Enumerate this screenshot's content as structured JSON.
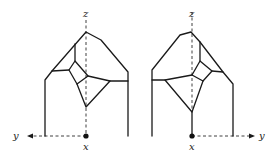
{
  "figures": [
    {
      "id": "left",
      "axes": {
        "z": "z",
        "x": "x",
        "y": "y"
      },
      "y_direction": "left"
    },
    {
      "id": "right",
      "axes": {
        "z": "z",
        "x": "x",
        "y": "y"
      },
      "y_direction": "right"
    }
  ],
  "colors": {
    "line": "#1a1a1a",
    "background": "#ffffff"
  }
}
